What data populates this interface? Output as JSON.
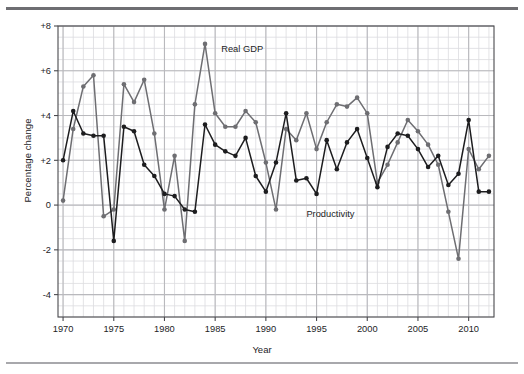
{
  "figure": {
    "background": "#ffffff",
    "top_rule_color": "#6e6e72",
    "bottom_rule_color": "#a8a8ac"
  },
  "chart_data": {
    "type": "line",
    "title": "",
    "xlabel": "Year",
    "ylabel": "Percentage change",
    "xlim": [
      1969.5,
      2012.5
    ],
    "ylim": [
      -5,
      8
    ],
    "xticks": [
      "1970",
      "1975",
      "1980",
      "1985",
      "1990",
      "1995",
      "2000",
      "2005",
      "2010"
    ],
    "xtick_values": [
      1970,
      1975,
      1980,
      1985,
      1990,
      1995,
      2000,
      2005,
      2010
    ],
    "yticks": [
      "+8",
      "+6",
      "+4",
      "+2",
      "0",
      "-2",
      "-4"
    ],
    "ytick_values": [
      8,
      6,
      4,
      2,
      0,
      -2,
      -4
    ],
    "grid": "major and minor gridlines, light gray",
    "grid_major_color": "#b9b9bd",
    "grid_minor_color": "#dcdce0",
    "axis_color": "#4a4a4e",
    "legend_position": "inline annotations on lines",
    "x": [
      1970,
      1971,
      1972,
      1973,
      1974,
      1975,
      1976,
      1977,
      1978,
      1979,
      1980,
      1981,
      1982,
      1983,
      1984,
      1985,
      1986,
      1987,
      1988,
      1989,
      1990,
      1991,
      1992,
      1993,
      1994,
      1995,
      1996,
      1997,
      1998,
      1999,
      2000,
      2001,
      2002,
      2003,
      2004,
      2005,
      2006,
      2007,
      2008,
      2009,
      2010,
      2011,
      2012
    ],
    "series": [
      {
        "name": "Real GDP",
        "color": "#6e6e72",
        "marker": "circle",
        "label_x": 1985.6,
        "label_y": 6.85,
        "values": [
          0.2,
          3.4,
          5.3,
          5.8,
          -0.5,
          -0.2,
          5.4,
          4.6,
          5.6,
          3.2,
          -0.2,
          2.2,
          -1.6,
          4.5,
          7.2,
          4.1,
          3.5,
          3.5,
          4.2,
          3.7,
          1.9,
          -0.2,
          3.4,
          2.9,
          4.1,
          2.5,
          3.7,
          4.5,
          4.4,
          4.8,
          4.1,
          1.0,
          1.8,
          2.8,
          3.8,
          3.3,
          2.7,
          1.8,
          -0.3,
          -2.4,
          2.5,
          1.6,
          2.2
        ]
      },
      {
        "name": "Productivity",
        "color": "#1d1d1f",
        "marker": "circle",
        "label_x": 1994.0,
        "label_y": -0.55,
        "values": [
          2.0,
          4.2,
          3.2,
          3.1,
          3.1,
          -1.6,
          3.5,
          3.3,
          1.8,
          1.3,
          0.5,
          0.4,
          -0.2,
          -0.3,
          3.6,
          2.7,
          2.4,
          2.2,
          3.0,
          1.3,
          0.6,
          1.9,
          4.1,
          1.1,
          1.2,
          0.5,
          2.9,
          1.6,
          2.8,
          3.4,
          2.1,
          0.8,
          2.6,
          3.2,
          3.1,
          2.5,
          1.7,
          2.2,
          0.9,
          1.4,
          3.8,
          0.6,
          0.6
        ]
      }
    ]
  },
  "annotations": [
    {
      "name": "real-gdp-label",
      "text": "Real GDP"
    },
    {
      "name": "productivity-label",
      "text": "Productivity"
    }
  ],
  "axis": {
    "x_title": "Year",
    "y_title": "Percentage change"
  }
}
